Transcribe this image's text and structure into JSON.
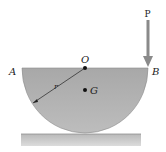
{
  "diagram": {
    "type": "hemisphere-on-surface",
    "labels": {
      "point_a": "A",
      "point_b": "B",
      "center": "O",
      "centroid": "G",
      "radius": "r",
      "force": "P"
    },
    "colors": {
      "hemisphere_fill": "#9d9d9d",
      "hemisphere_light": "#c4c4c4",
      "ground_fill": "#c8c8c8",
      "arrow": "#8a8a8a",
      "text": "#222222"
    }
  }
}
